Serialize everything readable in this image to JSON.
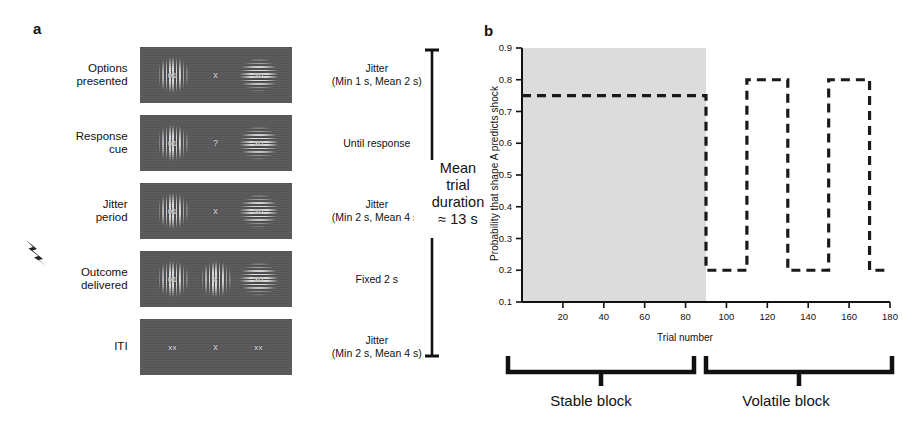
{
  "figure": {
    "panel_a_letter": "a",
    "panel_b_letter": "b"
  },
  "panel_a": {
    "stages": [
      {
        "label": "Options\npresented",
        "timing": "Jitter\n(Min 1 s, Mean 2 s)",
        "center_symbol": "x",
        "left_stim_text": "01",
        "right_stim_text": "30",
        "left_stim": "vertical-grating",
        "center_stim": "none",
        "right_stim": "horizontal-grating",
        "has_bolt": false
      },
      {
        "label": "Response\ncue",
        "timing": "Until response",
        "center_symbol": "?",
        "left_stim_text": "01",
        "right_stim_text": "30",
        "left_stim": "vertical-grating",
        "center_stim": "none",
        "right_stim": "horizontal-grating",
        "has_bolt": false
      },
      {
        "label": "Jitter\nperiod",
        "timing": "Jitter\n(Min 2 s, Mean 4 s)",
        "center_symbol": "x",
        "left_stim_text": "01",
        "right_stim_text": "30",
        "left_stim": "vertical-grating",
        "center_stim": "none",
        "right_stim": "horizontal-grating",
        "has_bolt": false
      },
      {
        "label": "Outcome\ndelivered",
        "timing": "Fixed 2 s",
        "center_symbol": "x",
        "left_stim_text": "01",
        "right_stim_text": "30",
        "left_stim": "vertical-grating",
        "center_stim": "vertical-grating",
        "right_stim": "horizontal-grating",
        "has_bolt": true
      },
      {
        "label": "ITI",
        "timing": "Jitter\n(Min 2 s, Mean 4 s)",
        "center_symbol": "x",
        "left_stim_text": "xx",
        "right_stim_text": "xx",
        "left_stim": "none",
        "center_stim": "none",
        "right_stim": "none",
        "has_bolt": false
      }
    ],
    "duration_note": "Mean\ntrial\nduration\n≈ 13 s"
  },
  "panel_b": {
    "stable_caption": "Stable block",
    "volatile_caption": "Volatile block"
  },
  "chart_data": {
    "type": "line",
    "title": "",
    "xlabel": "Trial number",
    "ylabel": "Probability that shape A predicts shock",
    "xlim": [
      0,
      180
    ],
    "ylim": [
      0.1,
      0.9
    ],
    "xticks": [
      20,
      40,
      60,
      80,
      100,
      120,
      140,
      160,
      180
    ],
    "yticks": [
      0.1,
      0.2,
      0.3,
      0.4,
      0.5,
      0.6,
      0.7,
      0.8,
      0.9
    ],
    "grid": false,
    "legend": "none",
    "line_style": "dashed",
    "line_color": "#1a1a1a",
    "shaded_region": {
      "label": "Stable block shading",
      "x_start": 0,
      "x_end": 90,
      "color": "#dcdcdc"
    },
    "series": [
      {
        "name": "Probability that shape A predicts shock",
        "style": "step",
        "points": [
          {
            "x": 0,
            "y": 0.75
          },
          {
            "x": 90,
            "y": 0.75
          },
          {
            "x": 90,
            "y": 0.2
          },
          {
            "x": 110,
            "y": 0.2
          },
          {
            "x": 110,
            "y": 0.8
          },
          {
            "x": 130,
            "y": 0.8
          },
          {
            "x": 130,
            "y": 0.2
          },
          {
            "x": 150,
            "y": 0.2
          },
          {
            "x": 150,
            "y": 0.8
          },
          {
            "x": 170,
            "y": 0.8
          },
          {
            "x": 170,
            "y": 0.2
          },
          {
            "x": 180,
            "y": 0.2
          }
        ]
      }
    ],
    "blocks": [
      {
        "name": "Stable block",
        "x_start": 0,
        "x_end": 90,
        "probability": 0.75
      },
      {
        "name": "Volatile block",
        "x_start": 90,
        "x_end": 180,
        "probabilities": [
          0.2,
          0.8,
          0.2,
          0.8,
          0.2
        ]
      }
    ]
  }
}
